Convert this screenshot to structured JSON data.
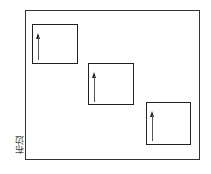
{
  "diagram": {
    "type": "fabric-layout",
    "labels": {
      "selvage": "布边"
    },
    "frame": {
      "x": 25,
      "y": 10,
      "width": 175,
      "height": 150
    },
    "pattern_pieces": [
      {
        "id": 1,
        "x": 32,
        "y": 24,
        "width": 46,
        "height": 40,
        "grain_arrow": "up"
      },
      {
        "id": 2,
        "x": 88,
        "y": 63,
        "width": 46,
        "height": 42,
        "grain_arrow": "up"
      },
      {
        "id": 3,
        "x": 146,
        "y": 102,
        "width": 45,
        "height": 43,
        "grain_arrow": "up"
      }
    ]
  }
}
